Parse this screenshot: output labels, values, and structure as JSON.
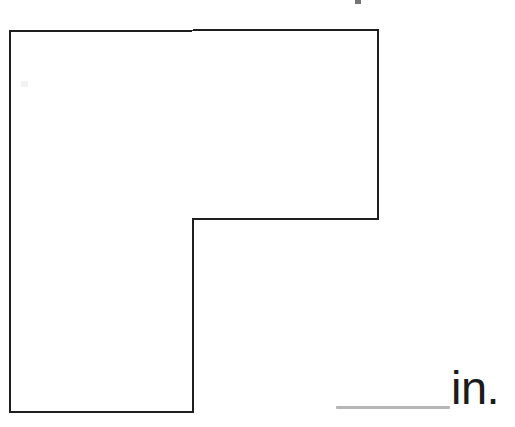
{
  "page": {
    "background_color": "#ffffff",
    "width": 515,
    "height": 427,
    "kind": "geometry-figure-worksheet"
  },
  "figure": {
    "name": "l-shaped-polygon",
    "shape_type": "L-shape",
    "stroke_color": "#1f1f1f",
    "fill_color": "#ffffff",
    "stroke_width": 2,
    "vertices_label": "A,B,C,D,E,F",
    "polygon_points": "10,31 378,30 378,219 193,219 193,412 10,412",
    "vertices": [
      {
        "label": "top-left",
        "x": 10,
        "y": 31
      },
      {
        "label": "top-right",
        "x": 378,
        "y": 30
      },
      {
        "label": "right-lower",
        "x": 378,
        "y": 219
      },
      {
        "label": "inner-notch",
        "x": 193,
        "y": 219
      },
      {
        "label": "bottom-right-leg",
        "x": 193,
        "y": 412
      },
      {
        "label": "bottom-left",
        "x": 10,
        "y": 412
      }
    ],
    "side_labels": []
  },
  "answer": {
    "blank_value": "",
    "blank_placeholder": "",
    "unit_label": "in.",
    "blank_color": "#b6b6b6",
    "text_color": "#1b1b1b"
  },
  "marks": {
    "top_edge_artifact": "scan-mark",
    "interior_artifact": "scan-mark"
  },
  "chart_data": {
    "type": "diagram",
    "title": "",
    "shape": "L-shaped polygon (rectilinear hexagon)",
    "vertices": [
      [
        10,
        31
      ],
      [
        378,
        30
      ],
      [
        378,
        219
      ],
      [
        193,
        219
      ],
      [
        193,
        412
      ],
      [
        10,
        412
      ]
    ],
    "unit": "in.",
    "labeled_dimensions": []
  }
}
